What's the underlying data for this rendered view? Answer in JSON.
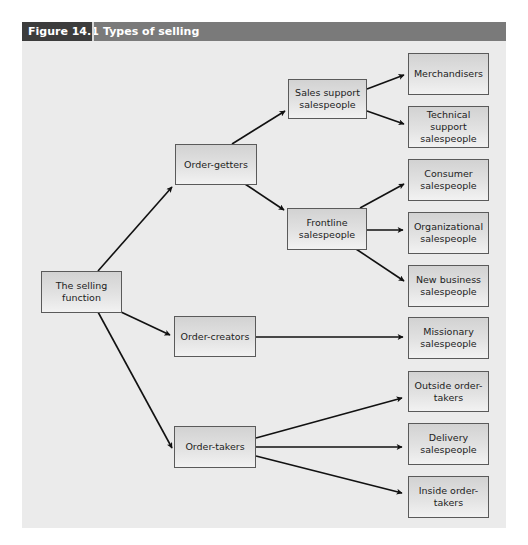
{
  "figure": {
    "number": "Figure 14.1",
    "title": "Types of selling"
  },
  "nodes": {
    "root": "The selling function",
    "order_getters": "Order-getters",
    "order_creators": "Order-creators",
    "order_takers": "Order-takers",
    "sales_support": "Sales support salespeople",
    "frontline": "Frontline salespeople",
    "merchandisers": "Merchandisers",
    "technical_support": "Technical support salespeople",
    "consumer": "Consumer salespeople",
    "organizational": "Organizational salespeople",
    "new_business": "New business salespeople",
    "missionary": "Missionary salespeople",
    "outside_order_takers": "Outside order-takers",
    "delivery": "Delivery salespeople",
    "inside_order_takers": "Inside order-takers"
  },
  "edges": [
    [
      "root",
      "order_getters"
    ],
    [
      "root",
      "order_creators"
    ],
    [
      "root",
      "order_takers"
    ],
    [
      "order_getters",
      "sales_support"
    ],
    [
      "order_getters",
      "frontline"
    ],
    [
      "sales_support",
      "merchandisers"
    ],
    [
      "sales_support",
      "technical_support"
    ],
    [
      "frontline",
      "consumer"
    ],
    [
      "frontline",
      "organizational"
    ],
    [
      "frontline",
      "new_business"
    ],
    [
      "order_creators",
      "missionary"
    ],
    [
      "order_takers",
      "outside_order_takers"
    ],
    [
      "order_takers",
      "delivery"
    ],
    [
      "order_takers",
      "inside_order_takers"
    ]
  ],
  "colors": {
    "header_bar": "#7a7a7a",
    "header_number_bg": "#3c3c3c",
    "panel_bg": "#ebebeb",
    "node_border": "#5a5a5a",
    "arrow": "#111111"
  }
}
